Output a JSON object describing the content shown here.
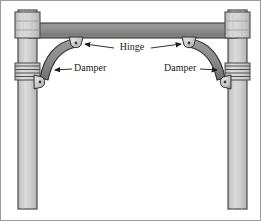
{
  "figure": {
    "background": "#ffffff",
    "border_color": "#9a9a9a",
    "width": 261,
    "height": 221
  },
  "palette": {
    "column_fill": "#c9c9c9",
    "column_light": "#dcdcdc",
    "column_outline": "#4a4a4a",
    "beam_fill": "#8c8c8c",
    "beam_dark": "#7a7a7a",
    "beam_outline": "#3c3c3c",
    "damper_fill": "#8a8a8a",
    "damper_outline": "#2e2e2e",
    "hinge_fill": "#c4c4c4",
    "hinge_outline": "#333333",
    "band_color": "#555555",
    "leader_color": "#222222",
    "text_color": "#1a1a1a"
  },
  "labels": [
    {
      "id": "hinge",
      "text": "Hinge",
      "x": 130,
      "y": 49,
      "anchor": "middle",
      "leader_left": {
        "x1": 104,
        "y1": 49,
        "x2": 116,
        "y2": 49
      },
      "leader_right": {
        "x1": 146,
        "y1": 49,
        "x2": 196,
        "y2": 49
      },
      "arrow_left": {
        "x": 80,
        "y": 49
      },
      "arrow_right": {
        "x": 199,
        "y": 49
      }
    },
    {
      "id": "damper-left",
      "text": "Damper",
      "x": 74,
      "y": 68,
      "anchor": "start",
      "leader": {
        "x1": 63,
        "y1": 68,
        "x2": 72,
        "y2": 68
      },
      "arrow": {
        "x": 54,
        "y": 70
      }
    },
    {
      "id": "damper-right",
      "text": "Damper",
      "x": 164,
      "y": 68,
      "anchor": "start",
      "leader": {
        "x1": 200,
        "y1": 68,
        "x2": 213,
        "y2": 68
      },
      "arrow": {
        "x": 219,
        "y": 70
      }
    }
  ],
  "components": {
    "left_column": {
      "x": 17,
      "y": 9,
      "width": 19,
      "height": 199
    },
    "right_column": {
      "x": 227,
      "y": 9,
      "width": 19,
      "height": 199
    },
    "beam": {
      "x": 30,
      "y": 22,
      "width": 204,
      "height": 15
    },
    "left_cap": {
      "x": 14,
      "y": 12,
      "width": 25,
      "height": 24
    },
    "right_cap": {
      "x": 224,
      "y": 12,
      "width": 25,
      "height": 24
    },
    "left_band": {
      "x": 14,
      "y": 63,
      "width": 25,
      "height": 15
    },
    "right_band": {
      "x": 224,
      "y": 63,
      "width": 25,
      "height": 15
    },
    "left_damper_arc": "M 72 44 C 56 46 44 58 40 78",
    "right_damper_arc": "M 192 44 C 208 46 220 58 224 78",
    "hinges": [
      {
        "id": "hinge-top-left",
        "cx": 74,
        "cy": 42,
        "r": 6
      },
      {
        "id": "hinge-top-right",
        "cx": 190,
        "cy": 42,
        "r": 6
      },
      {
        "id": "hinge-bottom-left",
        "cx": 39,
        "cy": 81,
        "r": 6
      },
      {
        "id": "hinge-bottom-right",
        "cx": 225,
        "cy": 81,
        "r": 6
      }
    ]
  }
}
